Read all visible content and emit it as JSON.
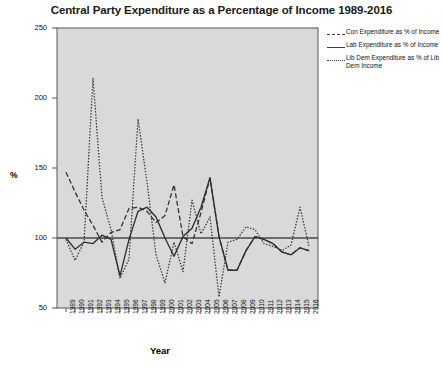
{
  "chart": {
    "title": "Central Party Expenditure as a Percentage of Income 1989-2016",
    "xlabel": "Year",
    "ylabel": "%"
  },
  "legend": {
    "items": [
      {
        "label": "Con Expenditure as % of Income",
        "style": "dashed",
        "name": "legend-item-con"
      },
      {
        "label": "Lab Expenditure as % of Income",
        "style": "solid",
        "name": "legend-item-lab"
      },
      {
        "label": "Lib Dem Expenditure as % of Lib Dem Income",
        "style": "dotted",
        "name": "legend-item-libdem"
      }
    ]
  },
  "chart_data": {
    "type": "line",
    "title": "Central Party Expenditure as a Percentage of Income 1989-2016",
    "xlabel": "Year",
    "ylabel": "%",
    "ylim": [
      50,
      250
    ],
    "yticks": [
      50,
      100,
      150,
      200,
      250
    ],
    "grid": false,
    "legend_position": "right-outside",
    "reference_line": 100,
    "categories": [
      "1989",
      "1990",
      "1991",
      "1992",
      "1993",
      "1994",
      "1995",
      "1996",
      "1997",
      "1998",
      "1999",
      "2000",
      "2001",
      "2002",
      "2003",
      "2004",
      "2005",
      "2006",
      "2007",
      "2008",
      "2009",
      "2010",
      "2011",
      "2012",
      "2013",
      "2014",
      "2015",
      "2016"
    ],
    "series": [
      {
        "name": "Con Expenditure as % of Income",
        "style": "dashed",
        "values": [
          147,
          133,
          120,
          109,
          97,
          104,
          106,
          121,
          122,
          119,
          111,
          116,
          138,
          101,
          96,
          118,
          143,
          101,
          77,
          77,
          91,
          101,
          99,
          96,
          90,
          88,
          93,
          91
        ]
      },
      {
        "name": "Lab Expenditure as % of Income",
        "style": "solid",
        "values": [
          100,
          92,
          97,
          96,
          102,
          99,
          73,
          99,
          119,
          122,
          115,
          100,
          87,
          101,
          107,
          122,
          143,
          101,
          77,
          77,
          91,
          101,
          99,
          96,
          90,
          88,
          93,
          91
        ]
      },
      {
        "name": "Lib Dem Expenditure as % of Lib Dem Income",
        "style": "dotted",
        "values": [
          99,
          84,
          97,
          214,
          129,
          106,
          71,
          85,
          185,
          140,
          88,
          68,
          97,
          76,
          127,
          103,
          115,
          58,
          97,
          99,
          108,
          106,
          96,
          94,
          91,
          95,
          122,
          94
        ]
      }
    ]
  }
}
